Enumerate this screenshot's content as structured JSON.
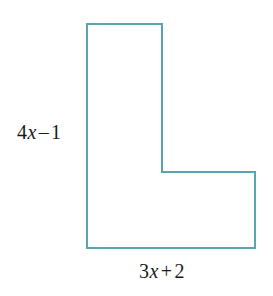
{
  "figure": {
    "type": "l-shaped-polygon",
    "background_color": "#ffffff",
    "stroke_color": "#5ba3ae",
    "stroke_width": 2,
    "fill_color": "none",
    "text_color": "#1a1a1a",
    "vertices": [
      [
        87,
        24
      ],
      [
        162,
        24
      ],
      [
        162,
        172
      ],
      [
        255,
        172
      ],
      [
        255,
        248
      ],
      [
        87,
        248
      ]
    ]
  },
  "labels": {
    "left": {
      "name": "height-dimension-label",
      "full_text": "4x – 1",
      "coefficient": "4",
      "variable": "x",
      "operator": "–",
      "constant": "1",
      "side": "left-vertical-edge"
    },
    "bottom": {
      "name": "width-dimension-label",
      "full_text": "3x + 2",
      "coefficient": "3",
      "variable": "x",
      "operator": "+",
      "constant": "2",
      "side": "bottom-horizontal-edge"
    }
  }
}
